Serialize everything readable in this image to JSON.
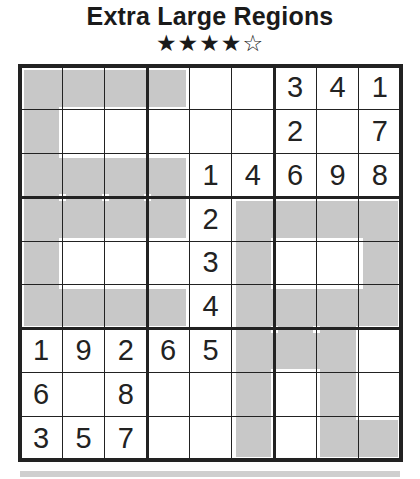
{
  "puzzle": {
    "title": "Extra Large Regions",
    "difficulty_stars": "★★★★☆",
    "difficulty": 4,
    "max_difficulty": 5
  },
  "grid": {
    "rows": [
      [
        "",
        "",
        "",
        "",
        "",
        "",
        "3",
        "4",
        "1"
      ],
      [
        "",
        "",
        "",
        "",
        "",
        "",
        "2",
        "",
        "7"
      ],
      [
        "",
        "",
        "",
        "",
        "1",
        "4",
        "6",
        "9",
        "8"
      ],
      [
        "",
        "",
        "",
        "",
        "2",
        "",
        "",
        "",
        ""
      ],
      [
        "",
        "",
        "",
        "",
        "3",
        "",
        "",
        "",
        ""
      ],
      [
        "",
        "",
        "",
        "",
        "4",
        "",
        "",
        "",
        ""
      ],
      [
        "1",
        "9",
        "2",
        "6",
        "5",
        "",
        "",
        "",
        ""
      ],
      [
        "6",
        "",
        "8",
        "",
        "",
        "",
        "",
        "",
        ""
      ],
      [
        "3",
        "5",
        "7",
        "",
        "",
        "",
        "",
        "",
        ""
      ]
    ],
    "shaded_cells": [
      [
        0,
        0
      ],
      [
        0,
        1
      ],
      [
        0,
        2
      ],
      [
        0,
        3
      ],
      [
        1,
        0
      ],
      [
        2,
        0
      ],
      [
        2,
        1
      ],
      [
        2,
        2
      ],
      [
        2,
        3
      ],
      [
        3,
        0
      ],
      [
        3,
        1
      ],
      [
        3,
        2
      ],
      [
        3,
        3
      ],
      [
        3,
        5
      ],
      [
        3,
        6
      ],
      [
        3,
        7
      ],
      [
        3,
        8
      ],
      [
        4,
        0
      ],
      [
        4,
        5
      ],
      [
        4,
        8
      ],
      [
        5,
        0
      ],
      [
        5,
        1
      ],
      [
        5,
        2
      ],
      [
        5,
        3
      ],
      [
        5,
        5
      ],
      [
        5,
        6
      ],
      [
        5,
        7
      ],
      [
        5,
        8
      ],
      [
        6,
        5
      ],
      [
        6,
        6
      ],
      [
        6,
        7
      ],
      [
        7,
        5
      ],
      [
        7,
        7
      ],
      [
        8,
        5
      ],
      [
        8,
        7
      ],
      [
        8,
        8
      ]
    ]
  },
  "colors": {
    "shade": "#c8c8c8",
    "lines": "#222222",
    "digits": "#222222"
  }
}
